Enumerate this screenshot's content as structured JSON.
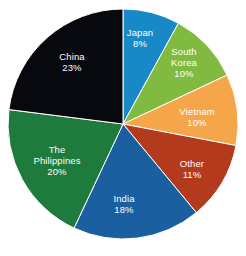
{
  "chart_data": {
    "type": "pie",
    "title": "",
    "subtitle": "",
    "xlabel": "",
    "ylabel": "",
    "legend_position": "none",
    "grid": false,
    "labels_inside_slices": true,
    "start_angle_deg": 0,
    "direction": "clockwise",
    "background_color": "#FFFFFF",
    "label_text_color": "#FFFFFF",
    "total_percent": 100,
    "categories": [
      "Japan",
      "South Korea",
      "Vietnam",
      "Other",
      "India",
      "The Philippines",
      "China"
    ],
    "values": [
      8,
      10,
      10,
      11,
      18,
      20,
      23
    ],
    "value_suffix": "%",
    "colors": [
      "#1789C7",
      "#81BA41",
      "#F5A64B",
      "#B33A1C",
      "#1A5FA0",
      "#1F7A3D",
      "#08080F"
    ],
    "slices": [
      {
        "name": "Japan",
        "value": 8,
        "value_label": "8%",
        "color": "#1789C7",
        "label_lines": [
          "Japan"
        ],
        "label_x": 140,
        "label_y": 38
      },
      {
        "name": "South Korea",
        "value": 10,
        "value_label": "10%",
        "color": "#81BA41",
        "label_lines": [
          "South",
          "Korea"
        ],
        "label_x": 184,
        "label_y": 62
      },
      {
        "name": "Vietnam",
        "value": 10,
        "value_label": "10%",
        "color": "#F5A64B",
        "label_lines": [
          "Vietnam"
        ],
        "label_x": 197,
        "label_y": 117
      },
      {
        "name": "Other",
        "value": 11,
        "value_label": "11%",
        "color": "#B33A1C",
        "label_lines": [
          "Other"
        ],
        "label_x": 192,
        "label_y": 169
      },
      {
        "name": "India",
        "value": 18,
        "value_label": "18%",
        "color": "#1A5FA0",
        "label_lines": [
          "India"
        ],
        "label_x": 124,
        "label_y": 204
      },
      {
        "name": "The Philippines",
        "value": 20,
        "value_label": "20%",
        "color": "#1F7A3D",
        "label_lines": [
          "The",
          "Philippines"
        ],
        "label_x": 57,
        "label_y": 160
      },
      {
        "name": "China",
        "value": 23,
        "value_label": "23%",
        "color": "#08080F",
        "label_lines": [
          "China"
        ],
        "label_x": 72,
        "label_y": 62
      }
    ],
    "geometry": {
      "center_x": 123,
      "center_y": 124,
      "radius": 115
    }
  }
}
